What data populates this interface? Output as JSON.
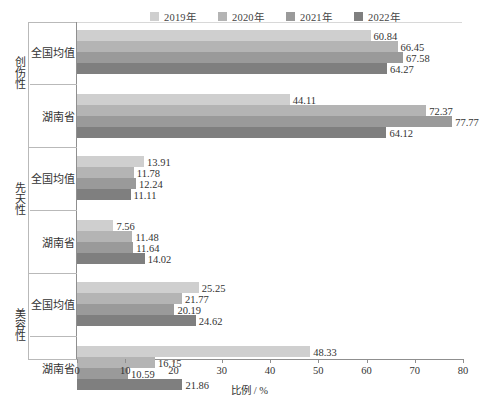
{
  "chart_data": {
    "type": "bar",
    "orientation": "horizontal",
    "title": "",
    "xlabel": "比例 / %",
    "ylabel": "",
    "xlim": [
      0,
      80
    ],
    "xticks": [
      0,
      10,
      20,
      30,
      40,
      50,
      60,
      70,
      80
    ],
    "grid": false,
    "legend_position": "top",
    "legend": [
      "2019年",
      "2020年",
      "2021年",
      "2022年"
    ],
    "series": [
      {
        "name": "2019年",
        "color": "#cfcfcf"
      },
      {
        "name": "2020年",
        "color": "#b4b4b4"
      },
      {
        "name": "2021年",
        "color": "#9a9a9a"
      },
      {
        "name": "2022年",
        "color": "#7f7f7f"
      }
    ],
    "categories": [
      "创伤性",
      "先天性",
      "美容性"
    ],
    "subcategories": [
      "全国均值",
      "湖南省"
    ],
    "groups": [
      {
        "category": "创伤性",
        "rows": [
          {
            "label": "全国均值",
            "values": [
              60.84,
              66.45,
              67.58,
              64.27
            ]
          },
          {
            "label": "湖南省",
            "values": [
              44.11,
              72.37,
              77.77,
              64.12
            ]
          }
        ]
      },
      {
        "category": "先天性",
        "rows": [
          {
            "label": "全国均值",
            "values": [
              13.91,
              11.78,
              12.24,
              11.11
            ]
          },
          {
            "label": "湖南省",
            "values": [
              7.56,
              11.48,
              11.64,
              14.02
            ]
          }
        ]
      },
      {
        "category": "美容性",
        "rows": [
          {
            "label": "全国均值",
            "values": [
              25.25,
              21.77,
              20.19,
              24.62
            ]
          },
          {
            "label": "湖南省",
            "values": [
              48.33,
              16.15,
              10.59,
              21.86
            ]
          }
        ]
      }
    ]
  }
}
